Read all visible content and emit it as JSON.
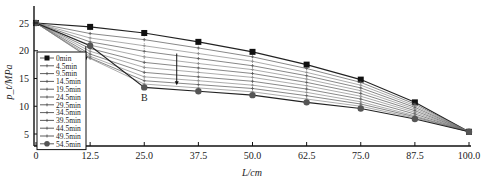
{
  "chart_data": {
    "type": "line",
    "title": "",
    "xlabel": "L/cm",
    "ylabel": "p_t/MPa",
    "x": [
      0,
      12.5,
      25.0,
      37.5,
      50.0,
      62.5,
      75.0,
      87.5,
      100.0
    ],
    "x_tick_labels": [
      "0",
      "12.5",
      "25.0",
      "37.5",
      "50.0",
      "62.5",
      "75.0",
      "87.5",
      "100.0"
    ],
    "y_ticks": [
      5,
      10,
      15,
      20,
      25
    ],
    "xlim": [
      0,
      100
    ],
    "ylim": [
      2.5,
      27.5
    ],
    "grid": false,
    "legend_position": "lower-left inside",
    "annotations": [
      {
        "text": "B",
        "x": 25.0,
        "y": 11.0
      },
      {
        "type": "arrow",
        "x": 32.5,
        "y_from": 19.5,
        "y_to": 13.8,
        "note": "downward arrow indicating decreasing pressure with time"
      },
      {
        "type": "arrow",
        "x": 11.5,
        "y_from": 20.8,
        "y_to": 18.2,
        "note": "small downward arrow at 12.5 cm"
      }
    ],
    "series": [
      {
        "name": "0min",
        "marker": "square",
        "values": [
          25.0,
          24.3,
          23.2,
          21.6,
          19.8,
          17.5,
          14.8,
          10.7,
          5.4
        ]
      },
      {
        "name": "4.5min",
        "marker": "plus",
        "values": [
          25.0,
          23.1,
          22.0,
          20.5,
          18.9,
          16.8,
          14.3,
          10.4,
          5.4
        ]
      },
      {
        "name": "9.5min",
        "marker": "plus",
        "values": [
          25.0,
          22.3,
          20.9,
          19.5,
          18.1,
          16.1,
          13.8,
          10.1,
          5.4
        ]
      },
      {
        "name": "14.5min",
        "marker": "plus",
        "values": [
          25.0,
          21.6,
          19.9,
          18.6,
          17.3,
          15.5,
          13.3,
          9.8,
          5.4
        ]
      },
      {
        "name": "19.5min",
        "marker": "plus",
        "values": [
          25.0,
          21.0,
          18.9,
          17.7,
          16.6,
          14.9,
          12.8,
          9.5,
          5.4
        ]
      },
      {
        "name": "24.5min",
        "marker": "plus",
        "values": [
          25.0,
          20.4,
          17.9,
          16.9,
          15.9,
          14.3,
          12.3,
          9.2,
          5.4
        ]
      },
      {
        "name": "29.5min",
        "marker": "plus",
        "values": [
          25.0,
          19.9,
          17.0,
          16.1,
          15.2,
          13.7,
          11.8,
          8.9,
          5.4
        ]
      },
      {
        "name": "34.5min",
        "marker": "plus",
        "values": [
          25.0,
          19.4,
          16.1,
          15.3,
          14.5,
          13.1,
          11.3,
          8.6,
          5.4
        ]
      },
      {
        "name": "39.5min",
        "marker": "plus",
        "values": [
          25.0,
          19.0,
          15.3,
          14.6,
          13.8,
          12.5,
          10.8,
          8.3,
          5.4
        ]
      },
      {
        "name": "44.5min",
        "marker": "plus",
        "values": [
          25.0,
          18.7,
          14.6,
          13.9,
          13.2,
          11.9,
          10.4,
          8.1,
          5.4
        ]
      },
      {
        "name": "49.5min",
        "marker": "plus",
        "values": [
          25.0,
          18.6,
          14.0,
          13.3,
          12.6,
          11.3,
          10.0,
          7.9,
          5.4
        ]
      },
      {
        "name": "54.5min",
        "marker": "circle",
        "values": [
          25.0,
          20.9,
          13.4,
          12.7,
          12.0,
          10.7,
          9.6,
          7.7,
          5.4
        ]
      }
    ]
  }
}
